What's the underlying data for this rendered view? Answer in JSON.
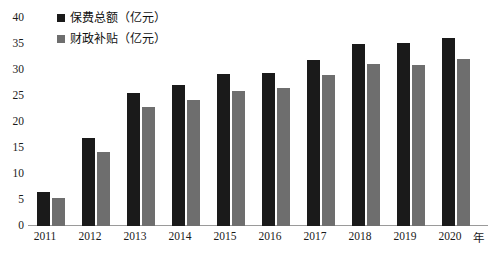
{
  "chart_data": {
    "type": "bar",
    "title": "",
    "subtitle": "",
    "xlabel": "年",
    "ylabel": "",
    "categories": [
      "2011",
      "2012",
      "2013",
      "2014",
      "2015",
      "2016",
      "2017",
      "2018",
      "2019",
      "2020"
    ],
    "series": [
      {
        "name": "保费总额（亿元）",
        "color": "#1a1a1a",
        "values": [
          6.5,
          17.0,
          25.5,
          27.2,
          29.2,
          29.5,
          32.0,
          35.0,
          35.2,
          36.2
        ]
      },
      {
        "name": "财政补贴（亿元）",
        "color": "#6e6e6e",
        "values": [
          5.4,
          14.2,
          22.8,
          24.2,
          26.0,
          26.6,
          29.0,
          31.2,
          31.0,
          32.2
        ]
      }
    ],
    "ylim": [
      0,
      40
    ],
    "ytick_step": 5,
    "yticks": [
      "0",
      "5",
      "10",
      "15",
      "20",
      "25",
      "30",
      "35",
      "40"
    ],
    "grid": false,
    "legend_position": "top-left",
    "axis_color": "#9a9a9a"
  },
  "legend": {
    "entries": [
      {
        "label": "保费总额（亿元）"
      },
      {
        "label": "财政补贴（亿元）"
      }
    ]
  }
}
